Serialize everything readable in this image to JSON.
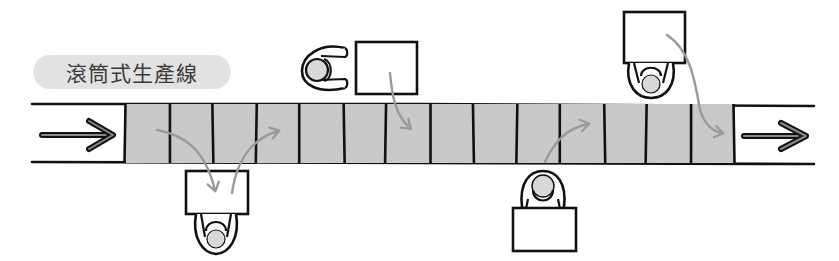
{
  "diagram": {
    "title": "滾筒式生產線",
    "colors": {
      "ink": "#111111",
      "cell_fill": "#c4c4c4",
      "flow_arrow": "#9a9a9a",
      "pill_bg": "#e2e2e2",
      "head_fill": "#d8d8d8"
    },
    "conveyor": {
      "cell_count": 14,
      "input_arrow": "right-arrow",
      "output_arrow": "right-arrow"
    },
    "workstations": [
      {
        "id": "ws1",
        "side": "bottom",
        "facing": "up",
        "flow": [
          "take-from-belt",
          "return-to-belt"
        ]
      },
      {
        "id": "ws2",
        "side": "top",
        "facing": "right",
        "flow": [
          "place-on-belt"
        ]
      },
      {
        "id": "ws3",
        "side": "bottom",
        "facing": "down",
        "flow": [
          "place-on-belt"
        ]
      },
      {
        "id": "ws4",
        "side": "top",
        "facing": "up",
        "flow": [
          "place-on-belt"
        ]
      }
    ]
  }
}
